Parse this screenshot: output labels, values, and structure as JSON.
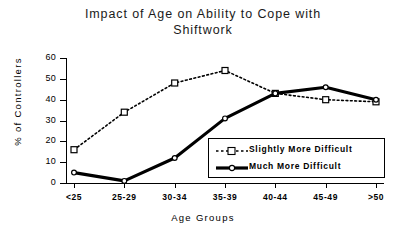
{
  "chart_data": {
    "type": "line",
    "title": "Impact of Age on Ability to Cope with Shiftwork",
    "title_line1": "Impact of Age on Ability to Cope with",
    "title_line2": "Shiftwork",
    "xlabel": "Age Groups",
    "ylabel": "% of Controllers",
    "categories": [
      "<25",
      "25-29",
      "30-34",
      "35-39",
      "40-44",
      "45-49",
      ">50"
    ],
    "ylim": [
      0,
      60
    ],
    "yticks": [
      0,
      10,
      20,
      30,
      40,
      50,
      60
    ],
    "grid": false,
    "legend_position": "center-right-inside",
    "series": [
      {
        "name": "Slightly More Difficult",
        "values": [
          16,
          34,
          48,
          54,
          43,
          40,
          39
        ],
        "style": "dotted",
        "marker": "open-square",
        "color": "#000000"
      },
      {
        "name": "Much More Difficult",
        "values": [
          5,
          1,
          12,
          31,
          43,
          46,
          40
        ],
        "style": "solid-thick",
        "marker": "open-circle",
        "color": "#000000"
      }
    ]
  }
}
